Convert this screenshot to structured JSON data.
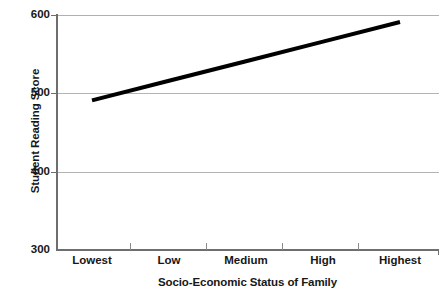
{
  "chart_data": {
    "type": "line",
    "title": "",
    "xlabel": "Socio-Economic Status of Family",
    "ylabel": "Student Reading Score",
    "categories": [
      "Lowest",
      "Low",
      "Medium",
      "High",
      "Highest"
    ],
    "series": [
      {
        "name": "Student Reading Score",
        "values": [
          491,
          516,
          541,
          566,
          591
        ],
        "color": "#000000",
        "line_width": 4
      }
    ],
    "ylim": [
      300,
      600
    ],
    "yticks": [
      300,
      400,
      500,
      600
    ],
    "ytick_labels": [
      "300",
      "400",
      "500",
      "600"
    ],
    "xtick_labels": [
      "Lowest",
      "Low",
      "Medium",
      "High",
      "Highest"
    ],
    "grid": {
      "horizontal": true,
      "vertical": false,
      "color": "#b4b4b4"
    },
    "legend": {
      "visible": false,
      "position": "none"
    },
    "axes": {
      "line_color": "#6e6e6e",
      "background": "#ffffff"
    }
  }
}
